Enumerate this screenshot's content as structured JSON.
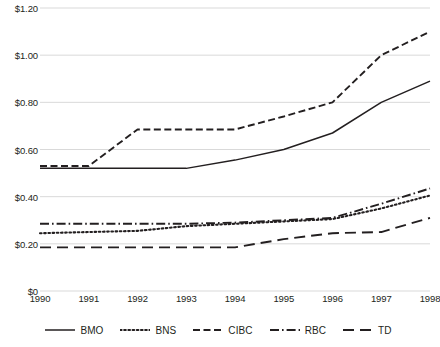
{
  "chart_data": {
    "type": "line",
    "title": "",
    "subtitle": "",
    "xlabel": "",
    "ylabel": "",
    "x": [
      1990,
      1991,
      1992,
      1993,
      1994,
      1995,
      1996,
      1997,
      1998
    ],
    "x_tick_labels": [
      "1990",
      "1991",
      "1992",
      "1993",
      "1994",
      "1995",
      "1996",
      "1997",
      "1998"
    ],
    "y_tick_values": [
      0,
      0.2,
      0.4,
      0.6,
      0.8,
      1.0,
      1.2
    ],
    "y_tick_labels": [
      "$0",
      "$0.20",
      "$0.40",
      "$0.60",
      "$0.80",
      "$1.00",
      "$1.20"
    ],
    "ylim": [
      0,
      1.2
    ],
    "xlim": [
      1990,
      1998
    ],
    "grid": "horizontal",
    "grid_color": "#d9d9d9",
    "legend_position": "bottom",
    "series": [
      {
        "name": "BMO",
        "style": "solid",
        "color": "#231f20",
        "values": [
          0.52,
          0.52,
          0.52,
          0.52,
          0.555,
          0.6,
          0.67,
          0.8,
          0.89
        ]
      },
      {
        "name": "BNS",
        "style": "dotted",
        "color": "#231f20",
        "values": [
          0.245,
          0.25,
          0.255,
          0.275,
          0.285,
          0.295,
          0.305,
          0.35,
          0.405
        ]
      },
      {
        "name": "CIBC",
        "style": "dashed",
        "color": "#231f20",
        "values": [
          0.53,
          0.53,
          0.685,
          0.685,
          0.685,
          0.74,
          0.8,
          1.0,
          1.1
        ]
      },
      {
        "name": "RBC",
        "style": "dashdot",
        "color": "#231f20",
        "values": [
          0.285,
          0.285,
          0.285,
          0.285,
          0.29,
          0.3,
          0.31,
          0.37,
          0.435
        ]
      },
      {
        "name": "TD",
        "style": "longdash",
        "color": "#231f20",
        "values": [
          0.185,
          0.185,
          0.185,
          0.185,
          0.185,
          0.22,
          0.245,
          0.25,
          0.31
        ]
      }
    ]
  },
  "legend": {
    "items": [
      {
        "label": "BMO",
        "style": "solid"
      },
      {
        "label": "BNS",
        "style": "dotted"
      },
      {
        "label": "CIBC",
        "style": "dashed"
      },
      {
        "label": "RBC",
        "style": "dashdot"
      },
      {
        "label": "TD",
        "style": "longdash"
      }
    ]
  }
}
